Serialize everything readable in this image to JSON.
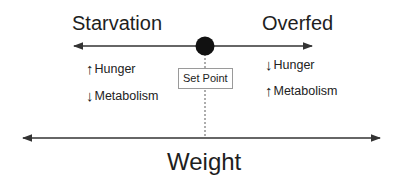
{
  "diagram": {
    "left_label": "Starvation",
    "right_label": "Overfed",
    "center_label": "Set Point",
    "axis_label": "Weight",
    "left_effects": [
      {
        "direction": "up",
        "glyph": "↑",
        "label": "Hunger"
      },
      {
        "direction": "down",
        "glyph": "↓",
        "label": "Metabolism"
      }
    ],
    "right_effects": [
      {
        "direction": "down",
        "glyph": "↓",
        "label": "Hunger"
      },
      {
        "direction": "up",
        "glyph": "↑",
        "label": "Metabolism"
      }
    ],
    "colors": {
      "line": "#333333",
      "dot": "#111111",
      "box_border": "#9a9a9a"
    }
  }
}
